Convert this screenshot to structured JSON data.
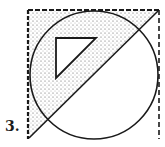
{
  "figure": {
    "label": "3.",
    "colors": {
      "stroke": "#1a1a1a",
      "stipple": "#555555",
      "background": "#ffffff"
    },
    "square": {
      "x1": 28,
      "y1": 10,
      "x2": 159,
      "y2": 139
    },
    "circle": {
      "cx": 94,
      "cy": 75,
      "r": 64
    },
    "diagonal": {
      "x1": 29,
      "y1": 138,
      "x2": 158,
      "y2": 11
    },
    "inner_triangle": {
      "points": "56,38 96,38 56,78"
    }
  }
}
